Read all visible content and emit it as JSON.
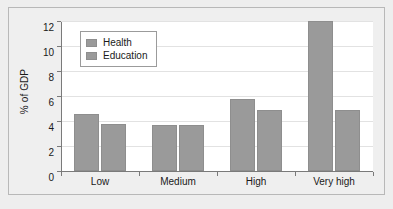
{
  "chart_data": {
    "type": "bar",
    "title": "",
    "xlabel": "",
    "ylabel": "% of GDP",
    "categories": [
      "Low",
      "Medium",
      "High",
      "Very high"
    ],
    "series": [
      {
        "name": "Health",
        "values": [
          4.6,
          3.7,
          5.75,
          12.0
        ]
      },
      {
        "name": "Education",
        "values": [
          3.8,
          3.65,
          4.85,
          4.85
        ]
      }
    ],
    "ylim": [
      0,
      12
    ],
    "yticks": [
      0,
      2,
      4,
      6,
      8,
      10,
      12
    ],
    "ytick_labels": [
      "0",
      "2",
      "4",
      "6",
      "8",
      "10",
      "12"
    ],
    "grid": true,
    "grid_axis": "y",
    "legend_position": "upper left",
    "colors": {
      "health": "#9a9a9a",
      "education": "#9a9a9a",
      "bar_edge": "#8e8e8e",
      "axis": "#7a7a7a",
      "grid": "#e2e2e2",
      "plot_background": "#ffffff",
      "figure_background": "#efefef",
      "frame": "#b8b8b8",
      "text": "#1a1a1a"
    }
  }
}
